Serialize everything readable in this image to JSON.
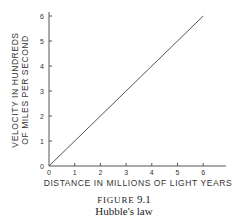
{
  "chart_data": {
    "type": "line",
    "title": "Hubble's law",
    "figure_label": "FIGURE",
    "figure_number": "9.1",
    "xlabel": "DISTANCE IN MILLIONS OF LIGHT YEARS",
    "ylabel_line1": "VELOCITY IN HUNDREDS",
    "ylabel_line2": "OF MILES PER SECOND",
    "x": [
      0,
      6
    ],
    "series": [
      {
        "name": "velocity",
        "values": [
          0,
          6
        ]
      }
    ],
    "xlim": [
      0,
      7
    ],
    "ylim": [
      0,
      6.3
    ],
    "xticks": [
      "0",
      "1",
      "2",
      "3",
      "4",
      "5",
      "6"
    ],
    "yticks": [
      "0",
      "1",
      "2",
      "3",
      "4",
      "5",
      "6"
    ],
    "grid": false,
    "legend": null
  }
}
